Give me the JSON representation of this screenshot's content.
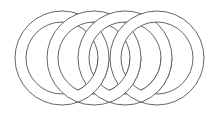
{
  "figure": {
    "width": 211,
    "height": 116,
    "background": "#ffffff",
    "stroke_color": "#555555",
    "stroke_width": 0.9,
    "ring_fill": "#ffffff",
    "rings": [
      {
        "cx": 62,
        "cy": 58,
        "outer_r": 47,
        "inner_r": 36
      },
      {
        "cx": 94,
        "cy": 58,
        "outer_r": 47,
        "inner_r": 36
      },
      {
        "cx": 125,
        "cy": 58,
        "outer_r": 47,
        "inner_r": 36
      },
      {
        "cx": 157,
        "cy": 58,
        "outer_r": 47,
        "inner_r": 36
      }
    ]
  }
}
